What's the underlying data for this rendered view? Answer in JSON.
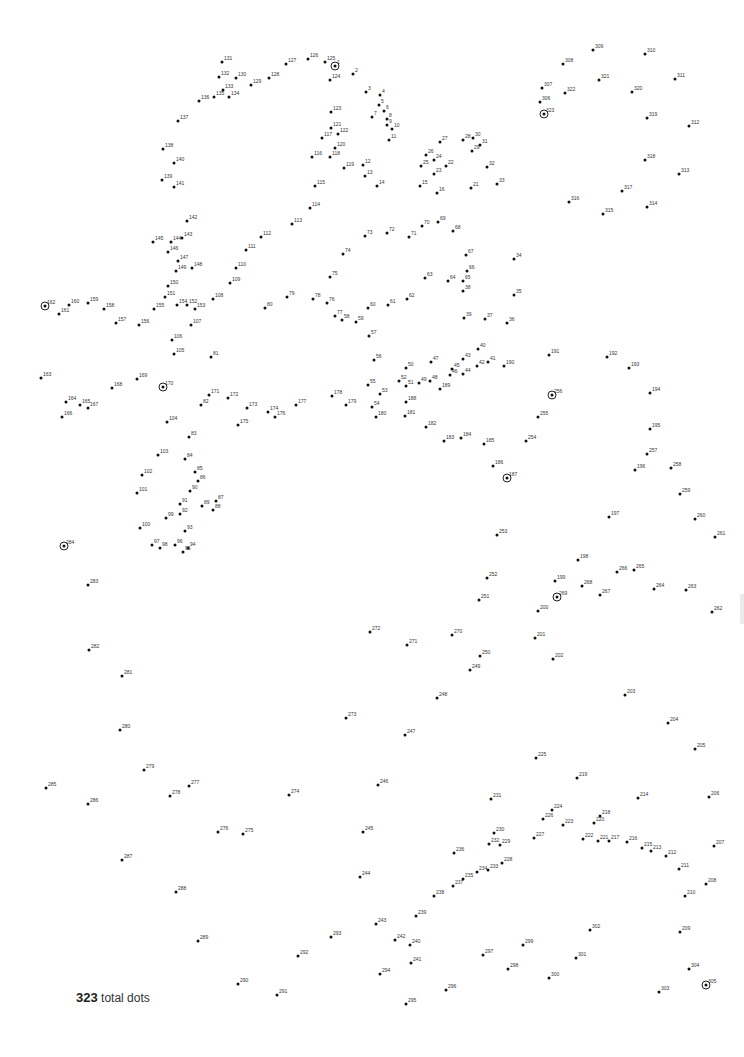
{
  "footer": {
    "count": "323",
    "suffix": "total dots"
  },
  "dots": [
    {
      "n": "1",
      "x": 335,
      "y": 66,
      "ring": true
    },
    {
      "n": "2",
      "x": 353,
      "y": 74
    },
    {
      "n": "3",
      "x": 366,
      "y": 92
    },
    {
      "n": "4",
      "x": 380,
      "y": 95
    },
    {
      "n": "5",
      "x": 379,
      "y": 105
    },
    {
      "n": "6",
      "x": 384,
      "y": 111
    },
    {
      "n": "7",
      "x": 372,
      "y": 117
    },
    {
      "n": "8",
      "x": 387,
      "y": 119
    },
    {
      "n": "9",
      "x": 387,
      "y": 125
    },
    {
      "n": "10",
      "x": 392,
      "y": 129
    },
    {
      "n": "11",
      "x": 389,
      "y": 140
    },
    {
      "n": "12",
      "x": 363,
      "y": 165
    },
    {
      "n": "13",
      "x": 365,
      "y": 176
    },
    {
      "n": "14",
      "x": 377,
      "y": 186
    },
    {
      "n": "15",
      "x": 420,
      "y": 186
    },
    {
      "n": "16",
      "x": 437,
      "y": 193
    },
    {
      "n": "21",
      "x": 471,
      "y": 188
    },
    {
      "n": "22",
      "x": 446,
      "y": 166
    },
    {
      "n": "23",
      "x": 434,
      "y": 174
    },
    {
      "n": "24",
      "x": 434,
      "y": 160
    },
    {
      "n": "25",
      "x": 421,
      "y": 166
    },
    {
      "n": "26",
      "x": 426,
      "y": 155
    },
    {
      "n": "27",
      "x": 440,
      "y": 142
    },
    {
      "n": "28",
      "x": 463,
      "y": 140
    },
    {
      "n": "29",
      "x": 472,
      "y": 151
    },
    {
      "n": "30",
      "x": 473,
      "y": 138
    },
    {
      "n": "31",
      "x": 480,
      "y": 145
    },
    {
      "n": "32",
      "x": 487,
      "y": 167
    },
    {
      "n": "33",
      "x": 497,
      "y": 184
    },
    {
      "n": "34",
      "x": 514,
      "y": 259
    },
    {
      "n": "35",
      "x": 514,
      "y": 295
    },
    {
      "n": "36",
      "x": 507,
      "y": 323
    },
    {
      "n": "37",
      "x": 485,
      "y": 319
    },
    {
      "n": "38",
      "x": 463,
      "y": 291
    },
    {
      "n": "39",
      "x": 464,
      "y": 318
    },
    {
      "n": "40",
      "x": 478,
      "y": 349
    },
    {
      "n": "41",
      "x": 488,
      "y": 362
    },
    {
      "n": "42",
      "x": 477,
      "y": 366
    },
    {
      "n": "43",
      "x": 463,
      "y": 359
    },
    {
      "n": "44",
      "x": 463,
      "y": 374
    },
    {
      "n": "45",
      "x": 452,
      "y": 369
    },
    {
      "n": "46",
      "x": 450,
      "y": 375
    },
    {
      "n": "47",
      "x": 431,
      "y": 362
    },
    {
      "n": "48",
      "x": 430,
      "y": 381
    },
    {
      "n": "49",
      "x": 419,
      "y": 383
    },
    {
      "n": "50",
      "x": 406,
      "y": 368
    },
    {
      "n": "51",
      "x": 406,
      "y": 386
    },
    {
      "n": "52",
      "x": 399,
      "y": 381
    },
    {
      "n": "53",
      "x": 380,
      "y": 394
    },
    {
      "n": "54",
      "x": 372,
      "y": 407
    },
    {
      "n": "55",
      "x": 368,
      "y": 385
    },
    {
      "n": "56",
      "x": 374,
      "y": 360
    },
    {
      "n": "57",
      "x": 369,
      "y": 336
    },
    {
      "n": "58",
      "x": 342,
      "y": 320
    },
    {
      "n": "59",
      "x": 356,
      "y": 322
    },
    {
      "n": "60",
      "x": 368,
      "y": 308
    },
    {
      "n": "61",
      "x": 388,
      "y": 305
    },
    {
      "n": "62",
      "x": 407,
      "y": 299
    },
    {
      "n": "63",
      "x": 425,
      "y": 278
    },
    {
      "n": "64",
      "x": 448,
      "y": 281
    },
    {
      "n": "65",
      "x": 463,
      "y": 281
    },
    {
      "n": "66",
      "x": 467,
      "y": 271
    },
    {
      "n": "67",
      "x": 466,
      "y": 255
    },
    {
      "n": "68",
      "x": 453,
      "y": 231
    },
    {
      "n": "69",
      "x": 438,
      "y": 222
    },
    {
      "n": "70",
      "x": 422,
      "y": 226
    },
    {
      "n": "71",
      "x": 409,
      "y": 237
    },
    {
      "n": "72",
      "x": 387,
      "y": 233
    },
    {
      "n": "73",
      "x": 365,
      "y": 236
    },
    {
      "n": "74",
      "x": 343,
      "y": 254
    },
    {
      "n": "75",
      "x": 330,
      "y": 277
    },
    {
      "n": "76",
      "x": 327,
      "y": 303
    },
    {
      "n": "77",
      "x": 335,
      "y": 316
    },
    {
      "n": "78",
      "x": 313,
      "y": 299
    },
    {
      "n": "79",
      "x": 287,
      "y": 297
    },
    {
      "n": "80",
      "x": 265,
      "y": 308
    },
    {
      "n": "81",
      "x": 211,
      "y": 357
    },
    {
      "n": "82",
      "x": 201,
      "y": 405
    },
    {
      "n": "83",
      "x": 189,
      "y": 437
    },
    {
      "n": "84",
      "x": 185,
      "y": 459
    },
    {
      "n": "85",
      "x": 195,
      "y": 472
    },
    {
      "n": "86",
      "x": 198,
      "y": 481
    },
    {
      "n": "87",
      "x": 216,
      "y": 501
    },
    {
      "n": "88",
      "x": 213,
      "y": 510
    },
    {
      "n": "89",
      "x": 202,
      "y": 506
    },
    {
      "n": "90",
      "x": 190,
      "y": 491
    },
    {
      "n": "91",
      "x": 180,
      "y": 504
    },
    {
      "n": "92",
      "x": 180,
      "y": 514
    },
    {
      "n": "93",
      "x": 185,
      "y": 531
    },
    {
      "n": "94",
      "x": 188,
      "y": 548
    },
    {
      "n": "95",
      "x": 183,
      "y": 552
    },
    {
      "n": "96",
      "x": 175,
      "y": 545
    },
    {
      "n": "97",
      "x": 152,
      "y": 545
    },
    {
      "n": "98",
      "x": 160,
      "y": 548
    },
    {
      "n": "99",
      "x": 166,
      "y": 518
    },
    {
      "n": "100",
      "x": 140,
      "y": 528
    },
    {
      "n": "101",
      "x": 137,
      "y": 493
    },
    {
      "n": "102",
      "x": 142,
      "y": 475
    },
    {
      "n": "103",
      "x": 158,
      "y": 455
    },
    {
      "n": "104",
      "x": 167,
      "y": 422
    },
    {
      "n": "105",
      "x": 174,
      "y": 354
    },
    {
      "n": "106",
      "x": 172,
      "y": 340
    },
    {
      "n": "107",
      "x": 191,
      "y": 325
    },
    {
      "n": "108",
      "x": 213,
      "y": 299
    },
    {
      "n": "109",
      "x": 230,
      "y": 283
    },
    {
      "n": "110",
      "x": 236,
      "y": 268
    },
    {
      "n": "111",
      "x": 246,
      "y": 250
    },
    {
      "n": "112",
      "x": 261,
      "y": 237
    },
    {
      "n": "113",
      "x": 292,
      "y": 224
    },
    {
      "n": "114",
      "x": 310,
      "y": 208
    },
    {
      "n": "115",
      "x": 315,
      "y": 186
    },
    {
      "n": "116",
      "x": 312,
      "y": 157
    },
    {
      "n": "117",
      "x": 322,
      "y": 138
    },
    {
      "n": "118",
      "x": 330,
      "y": 157
    },
    {
      "n": "119",
      "x": 344,
      "y": 168
    },
    {
      "n": "120",
      "x": 335,
      "y": 148
    },
    {
      "n": "121",
      "x": 331,
      "y": 128
    },
    {
      "n": "122",
      "x": 338,
      "y": 134
    },
    {
      "n": "123",
      "x": 331,
      "y": 112
    },
    {
      "n": "124",
      "x": 330,
      "y": 80
    },
    {
      "n": "125",
      "x": 325,
      "y": 62
    },
    {
      "n": "126",
      "x": 308,
      "y": 59
    },
    {
      "n": "127",
      "x": 286,
      "y": 64
    },
    {
      "n": "128",
      "x": 269,
      "y": 78
    },
    {
      "n": "129",
      "x": 251,
      "y": 85
    },
    {
      "n": "130",
      "x": 236,
      "y": 78
    },
    {
      "n": "131",
      "x": 222,
      "y": 62
    },
    {
      "n": "132",
      "x": 219,
      "y": 77
    },
    {
      "n": "133",
      "x": 223,
      "y": 90
    },
    {
      "n": "134",
      "x": 229,
      "y": 97
    },
    {
      "n": "135",
      "x": 214,
      "y": 97
    },
    {
      "n": "136",
      "x": 199,
      "y": 101
    },
    {
      "n": "137",
      "x": 178,
      "y": 121
    },
    {
      "n": "138",
      "x": 163,
      "y": 149
    },
    {
      "n": "139",
      "x": 162,
      "y": 180
    },
    {
      "n": "140",
      "x": 174,
      "y": 163
    },
    {
      "n": "141",
      "x": 174,
      "y": 187
    },
    {
      "n": "142",
      "x": 187,
      "y": 221
    },
    {
      "n": "143",
      "x": 182,
      "y": 238
    },
    {
      "n": "144",
      "x": 171,
      "y": 242
    },
    {
      "n": "145",
      "x": 153,
      "y": 242
    },
    {
      "n": "146",
      "x": 168,
      "y": 252
    },
    {
      "n": "147",
      "x": 178,
      "y": 261
    },
    {
      "n": "148",
      "x": 192,
      "y": 268
    },
    {
      "n": "149",
      "x": 176,
      "y": 271
    },
    {
      "n": "150",
      "x": 168,
      "y": 286
    },
    {
      "n": "151",
      "x": 165,
      "y": 297
    },
    {
      "n": "152",
      "x": 187,
      "y": 305
    },
    {
      "n": "153",
      "x": 195,
      "y": 309
    },
    {
      "n": "154",
      "x": 177,
      "y": 305
    },
    {
      "n": "155",
      "x": 154,
      "y": 309
    },
    {
      "n": "156",
      "x": 139,
      "y": 325
    },
    {
      "n": "157",
      "x": 116,
      "y": 323
    },
    {
      "n": "158",
      "x": 104,
      "y": 309
    },
    {
      "n": "159",
      "x": 88,
      "y": 303
    },
    {
      "n": "160",
      "x": 69,
      "y": 305
    },
    {
      "n": "161",
      "x": 59,
      "y": 314
    },
    {
      "n": "162",
      "x": 45,
      "y": 306,
      "ring": true
    },
    {
      "n": "163",
      "x": 41,
      "y": 378
    },
    {
      "n": "164",
      "x": 66,
      "y": 402
    },
    {
      "n": "165",
      "x": 80,
      "y": 405
    },
    {
      "n": "166",
      "x": 62,
      "y": 417
    },
    {
      "n": "167",
      "x": 88,
      "y": 408
    },
    {
      "n": "168",
      "x": 112,
      "y": 388
    },
    {
      "n": "169",
      "x": 137,
      "y": 379
    },
    {
      "n": "170",
      "x": 163,
      "y": 387,
      "ring": true
    },
    {
      "n": "171",
      "x": 209,
      "y": 395
    },
    {
      "n": "172",
      "x": 228,
      "y": 398
    },
    {
      "n": "173",
      "x": 247,
      "y": 408
    },
    {
      "n": "174",
      "x": 268,
      "y": 412
    },
    {
      "n": "175",
      "x": 238,
      "y": 425
    },
    {
      "n": "176",
      "x": 275,
      "y": 417
    },
    {
      "n": "177",
      "x": 296,
      "y": 405
    },
    {
      "n": "178",
      "x": 332,
      "y": 396
    },
    {
      "n": "179",
      "x": 346,
      "y": 405
    },
    {
      "n": "180",
      "x": 376,
      "y": 417
    },
    {
      "n": "181",
      "x": 405,
      "y": 416
    },
    {
      "n": "182",
      "x": 426,
      "y": 427
    },
    {
      "n": "183",
      "x": 444,
      "y": 441
    },
    {
      "n": "184",
      "x": 461,
      "y": 438
    },
    {
      "n": "185",
      "x": 484,
      "y": 444
    },
    {
      "n": "186",
      "x": 493,
      "y": 466
    },
    {
      "n": "187",
      "x": 507,
      "y": 478,
      "ring": true
    },
    {
      "n": "188",
      "x": 406,
      "y": 402
    },
    {
      "n": "189",
      "x": 440,
      "y": 389
    },
    {
      "n": "190",
      "x": 504,
      "y": 366
    },
    {
      "n": "191",
      "x": 549,
      "y": 355
    },
    {
      "n": "192",
      "x": 607,
      "y": 357
    },
    {
      "n": "193",
      "x": 629,
      "y": 368
    },
    {
      "n": "194",
      "x": 650,
      "y": 393
    },
    {
      "n": "195",
      "x": 650,
      "y": 429
    },
    {
      "n": "196",
      "x": 635,
      "y": 470
    },
    {
      "n": "197",
      "x": 609,
      "y": 517
    },
    {
      "n": "198",
      "x": 578,
      "y": 560
    },
    {
      "n": "199",
      "x": 555,
      "y": 581
    },
    {
      "n": "200",
      "x": 538,
      "y": 611
    },
    {
      "n": "201",
      "x": 535,
      "y": 638
    },
    {
      "n": "202",
      "x": 553,
      "y": 659
    },
    {
      "n": "203",
      "x": 625,
      "y": 695
    },
    {
      "n": "204",
      "x": 668,
      "y": 723
    },
    {
      "n": "205",
      "x": 695,
      "y": 749
    },
    {
      "n": "206",
      "x": 709,
      "y": 797
    },
    {
      "n": "207",
      "x": 714,
      "y": 846
    },
    {
      "n": "208",
      "x": 706,
      "y": 884
    },
    {
      "n": "209",
      "x": 680,
      "y": 932
    },
    {
      "n": "210",
      "x": 685,
      "y": 896
    },
    {
      "n": "211",
      "x": 679,
      "y": 869
    },
    {
      "n": "212",
      "x": 666,
      "y": 856
    },
    {
      "n": "213",
      "x": 651,
      "y": 851
    },
    {
      "n": "214",
      "x": 638,
      "y": 798
    },
    {
      "n": "215",
      "x": 642,
      "y": 848
    },
    {
      "n": "216",
      "x": 627,
      "y": 842
    },
    {
      "n": "217",
      "x": 609,
      "y": 841
    },
    {
      "n": "218",
      "x": 600,
      "y": 816
    },
    {
      "n": "219",
      "x": 577,
      "y": 778
    },
    {
      "n": "220",
      "x": 594,
      "y": 823
    },
    {
      "n": "221",
      "x": 598,
      "y": 841
    },
    {
      "n": "222",
      "x": 583,
      "y": 839
    },
    {
      "n": "223",
      "x": 563,
      "y": 825
    },
    {
      "n": "224",
      "x": 552,
      "y": 810
    },
    {
      "n": "225",
      "x": 536,
      "y": 758
    },
    {
      "n": "226",
      "x": 543,
      "y": 819
    },
    {
      "n": "227",
      "x": 534,
      "y": 838
    },
    {
      "n": "228",
      "x": 502,
      "y": 863
    },
    {
      "n": "229",
      "x": 500,
      "y": 845
    },
    {
      "n": "230",
      "x": 494,
      "y": 833
    },
    {
      "n": "231",
      "x": 491,
      "y": 799
    },
    {
      "n": "232",
      "x": 489,
      "y": 844
    },
    {
      "n": "233",
      "x": 488,
      "y": 870
    },
    {
      "n": "234",
      "x": 477,
      "y": 872
    },
    {
      "n": "235",
      "x": 463,
      "y": 879
    },
    {
      "n": "236",
      "x": 454,
      "y": 853
    },
    {
      "n": "237",
      "x": 453,
      "y": 886
    },
    {
      "n": "238",
      "x": 434,
      "y": 896
    },
    {
      "n": "239",
      "x": 416,
      "y": 916
    },
    {
      "n": "240",
      "x": 410,
      "y": 945
    },
    {
      "n": "241",
      "x": 411,
      "y": 963
    },
    {
      "n": "242",
      "x": 395,
      "y": 940
    },
    {
      "n": "243",
      "x": 376,
      "y": 924
    },
    {
      "n": "244",
      "x": 360,
      "y": 877
    },
    {
      "n": "245",
      "x": 363,
      "y": 832
    },
    {
      "n": "246",
      "x": 378,
      "y": 785
    },
    {
      "n": "247",
      "x": 405,
      "y": 735
    },
    {
      "n": "248",
      "x": 437,
      "y": 698
    },
    {
      "n": "249",
      "x": 470,
      "y": 670
    },
    {
      "n": "250",
      "x": 480,
      "y": 656
    },
    {
      "n": "251",
      "x": 479,
      "y": 600
    },
    {
      "n": "252",
      "x": 487,
      "y": 578
    },
    {
      "n": "253",
      "x": 497,
      "y": 535
    },
    {
      "n": "254",
      "x": 526,
      "y": 441
    },
    {
      "n": "255",
      "x": 538,
      "y": 417
    },
    {
      "n": "256",
      "x": 552,
      "y": 395,
      "ring": true
    },
    {
      "n": "257",
      "x": 647,
      "y": 454
    },
    {
      "n": "258",
      "x": 671,
      "y": 468
    },
    {
      "n": "259",
      "x": 680,
      "y": 494
    },
    {
      "n": "260",
      "x": 695,
      "y": 519
    },
    {
      "n": "261",
      "x": 715,
      "y": 537
    },
    {
      "n": "262",
      "x": 712,
      "y": 612
    },
    {
      "n": "263",
      "x": 686,
      "y": 590
    },
    {
      "n": "264",
      "x": 654,
      "y": 589
    },
    {
      "n": "265",
      "x": 634,
      "y": 570
    },
    {
      "n": "266",
      "x": 617,
      "y": 572
    },
    {
      "n": "267",
      "x": 600,
      "y": 595
    },
    {
      "n": "268",
      "x": 582,
      "y": 586
    },
    {
      "n": "269",
      "x": 557,
      "y": 597,
      "ring": true
    },
    {
      "n": "270",
      "x": 452,
      "y": 635
    },
    {
      "n": "271",
      "x": 407,
      "y": 645
    },
    {
      "n": "272",
      "x": 370,
      "y": 632
    },
    {
      "n": "273",
      "x": 346,
      "y": 718
    },
    {
      "n": "274",
      "x": 289,
      "y": 795
    },
    {
      "n": "275",
      "x": 243,
      "y": 834
    },
    {
      "n": "276",
      "x": 218,
      "y": 832
    },
    {
      "n": "277",
      "x": 189,
      "y": 786
    },
    {
      "n": "278",
      "x": 170,
      "y": 796
    },
    {
      "n": "279",
      "x": 144,
      "y": 770
    },
    {
      "n": "280",
      "x": 120,
      "y": 730
    },
    {
      "n": "281",
      "x": 122,
      "y": 676
    },
    {
      "n": "282",
      "x": 89,
      "y": 650
    },
    {
      "n": "283",
      "x": 88,
      "y": 585
    },
    {
      "n": "284",
      "x": 64,
      "y": 546,
      "ring": true
    },
    {
      "n": "285",
      "x": 46,
      "y": 788
    },
    {
      "n": "286",
      "x": 88,
      "y": 804
    },
    {
      "n": "287",
      "x": 122,
      "y": 860
    },
    {
      "n": "288",
      "x": 176,
      "y": 892
    },
    {
      "n": "289",
      "x": 198,
      "y": 941
    },
    {
      "n": "290",
      "x": 238,
      "y": 984
    },
    {
      "n": "291",
      "x": 277,
      "y": 995
    },
    {
      "n": "292",
      "x": 298,
      "y": 956
    },
    {
      "n": "293",
      "x": 331,
      "y": 937
    },
    {
      "n": "294",
      "x": 380,
      "y": 974
    },
    {
      "n": "295",
      "x": 406,
      "y": 1004
    },
    {
      "n": "296",
      "x": 446,
      "y": 990
    },
    {
      "n": "297",
      "x": 483,
      "y": 955
    },
    {
      "n": "298",
      "x": 508,
      "y": 969
    },
    {
      "n": "299",
      "x": 523,
      "y": 945
    },
    {
      "n": "300",
      "x": 549,
      "y": 978
    },
    {
      "n": "301",
      "x": 576,
      "y": 958
    },
    {
      "n": "302",
      "x": 590,
      "y": 930
    },
    {
      "n": "303",
      "x": 659,
      "y": 992
    },
    {
      "n": "304",
      "x": 689,
      "y": 969
    },
    {
      "n": "305",
      "x": 706,
      "y": 985,
      "ring": true
    },
    {
      "n": "306",
      "x": 540,
      "y": 102
    },
    {
      "n": "307",
      "x": 542,
      "y": 88
    },
    {
      "n": "308",
      "x": 563,
      "y": 64
    },
    {
      "n": "309",
      "x": 593,
      "y": 50
    },
    {
      "n": "310",
      "x": 645,
      "y": 54
    },
    {
      "n": "311",
      "x": 675,
      "y": 79
    },
    {
      "n": "312",
      "x": 689,
      "y": 126
    },
    {
      "n": "313",
      "x": 679,
      "y": 174
    },
    {
      "n": "314",
      "x": 647,
      "y": 207
    },
    {
      "n": "315",
      "x": 603,
      "y": 214
    },
    {
      "n": "316",
      "x": 569,
      "y": 202
    },
    {
      "n": "317",
      "x": 622,
      "y": 191
    },
    {
      "n": "318",
      "x": 645,
      "y": 160
    },
    {
      "n": "319",
      "x": 647,
      "y": 118
    },
    {
      "n": "320",
      "x": 632,
      "y": 92
    },
    {
      "n": "321",
      "x": 599,
      "y": 80
    },
    {
      "n": "322",
      "x": 565,
      "y": 93
    },
    {
      "n": "323",
      "x": 544,
      "y": 114,
      "ring": true
    }
  ]
}
